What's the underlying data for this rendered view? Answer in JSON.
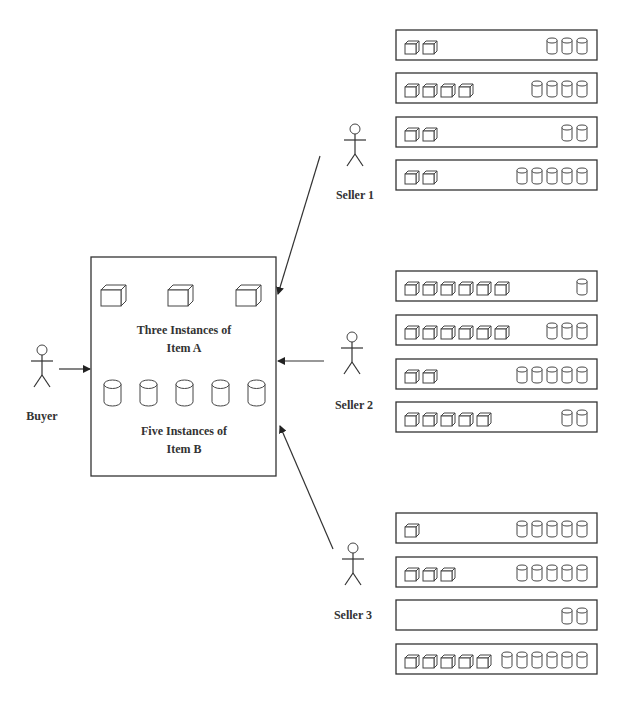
{
  "buyer": {
    "label": "Buyer",
    "request": {
      "item_a_count": 3,
      "item_a_caption_line1": "Three Instances of",
      "item_a_caption_line2": "Item A",
      "item_b_count": 5,
      "item_b_caption_line1": "Five Instances of",
      "item_b_caption_line2": "Item B"
    }
  },
  "legend": {
    "item_a_icon": "cube-icon",
    "item_b_icon": "cylinder-icon"
  },
  "sellers": [
    {
      "label": "Seller 1",
      "bundles": [
        {
          "a": 2,
          "b": 3
        },
        {
          "a": 4,
          "b": 4
        },
        {
          "a": 2,
          "b": 2
        },
        {
          "a": 2,
          "b": 5
        }
      ]
    },
    {
      "label": "Seller 2",
      "bundles": [
        {
          "a": 6,
          "b": 1
        },
        {
          "a": 6,
          "b": 3
        },
        {
          "a": 2,
          "b": 5
        },
        {
          "a": 5,
          "b": 2
        }
      ]
    },
    {
      "label": "Seller 3",
      "bundles": [
        {
          "a": 1,
          "b": 5
        },
        {
          "a": 3,
          "b": 5
        },
        {
          "a": 0,
          "b": 2
        },
        {
          "a": 5,
          "b": 6
        }
      ]
    }
  ]
}
